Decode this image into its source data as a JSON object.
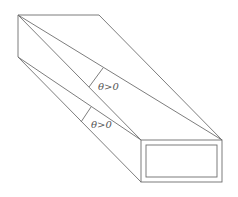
{
  "diagram": {
    "labels": [
      {
        "text": "θ>0",
        "x": 98,
        "y": 90
      },
      {
        "text": "θ>0",
        "x": 91,
        "y": 128
      }
    ],
    "colors": {
      "line": "#6e6e6e",
      "label": "#555555",
      "background": "#ffffff"
    }
  }
}
